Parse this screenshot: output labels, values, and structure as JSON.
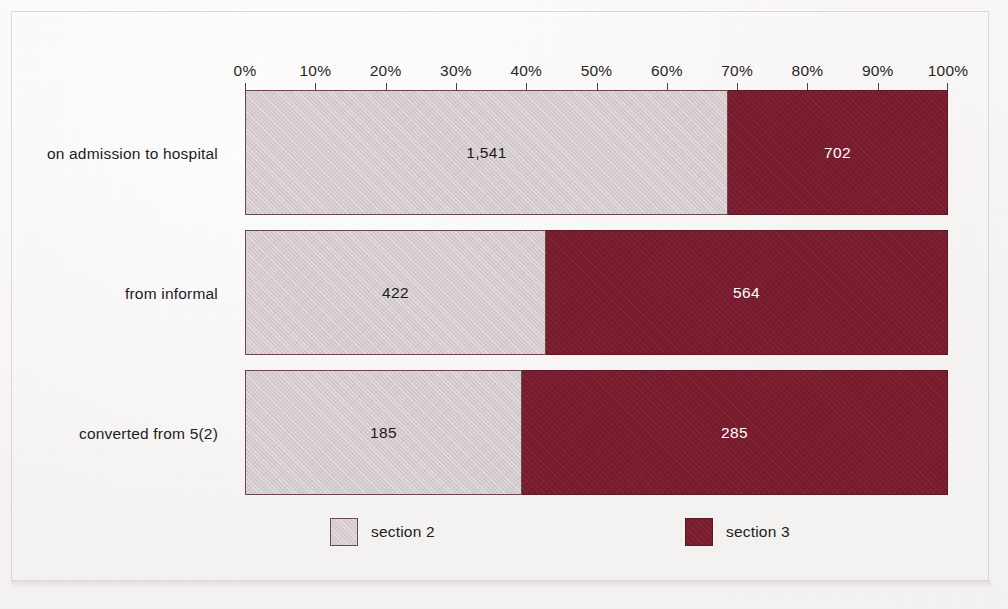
{
  "chart_data": {
    "type": "bar",
    "orientation": "horizontal",
    "stacked": true,
    "normalized": true,
    "title": "",
    "subtitle": "",
    "xlabel": "",
    "ylabel": "",
    "xlim": [
      0,
      100
    ],
    "grid": false,
    "legend_position": "bottom",
    "categories": [
      "on admission to hospital",
      "from informal",
      "converted from 5(2)"
    ],
    "tick_labels": [
      "0%",
      "10%",
      "20%",
      "30%",
      "40%",
      "50%",
      "60%",
      "70%",
      "80%",
      "90%",
      "100%"
    ],
    "tick_values": [
      0,
      10,
      20,
      30,
      40,
      50,
      60,
      70,
      80,
      90,
      100
    ],
    "series": [
      {
        "name": "section 2",
        "color": "#d4cbce",
        "values": [
          1541,
          422,
          185
        ],
        "labels": [
          "1,541",
          "422",
          "185"
        ],
        "percent": [
          68.7,
          42.8,
          39.4
        ]
      },
      {
        "name": "section 3",
        "color": "#781c2e",
        "values": [
          702,
          564,
          285
        ],
        "labels": [
          "702",
          "564",
          "285"
        ],
        "percent": [
          31.3,
          57.2,
          60.6
        ]
      }
    ],
    "totals": [
      2243,
      986,
      470
    ]
  },
  "legend": {
    "items": [
      {
        "label": "section 2",
        "color": "#d4cbce"
      },
      {
        "label": "section 3",
        "color": "#781c2e"
      }
    ]
  },
  "colors": {
    "background": "#f6f3f3",
    "section2": "#d4cbce",
    "section3": "#781c2e",
    "bar_border": "#6f4650",
    "axis": "#4a3f43",
    "text": "#211d1d",
    "label_on_dark": "#ffffff"
  }
}
